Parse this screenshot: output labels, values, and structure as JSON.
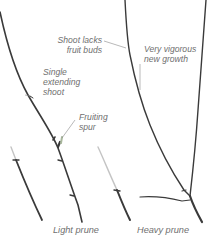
{
  "diagram": {
    "type": "botanical-illustration",
    "colors": {
      "background": "#ffffff",
      "branch": "#3a3a3a",
      "cut_tip": "#bdbdbd",
      "label_text": "#6f6f6f",
      "leader_line": "#8a8a8a"
    },
    "annotations": {
      "shoot_lacks_fruit_buds": {
        "line1": "Shoot lacks",
        "line2": "fruit buds"
      },
      "very_vigorous_new_growth": {
        "line1": "Very vigorous",
        "line2": "new growth"
      },
      "single_extending_shoot": {
        "line1": "Single",
        "line2": "extending",
        "line3": "shoot"
      },
      "fruiting_spur": {
        "line1": "Fruiting",
        "line2": "spur"
      }
    },
    "captions": {
      "light_prune": "Light prune",
      "heavy_prune": "Heavy prune"
    }
  }
}
